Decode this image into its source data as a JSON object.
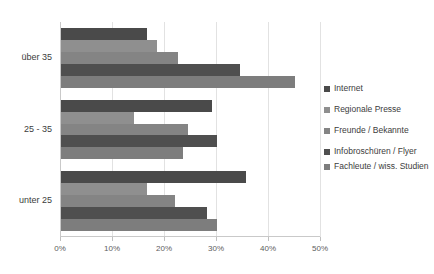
{
  "chart_data": {
    "type": "bar",
    "orientation": "horizontal",
    "title": "",
    "xlabel": "",
    "ylabel": "",
    "xlim": [
      0,
      50
    ],
    "xtick_labels": [
      "0%",
      "10%",
      "20%",
      "30%",
      "40%",
      "50%"
    ],
    "xticks": [
      0,
      10,
      20,
      30,
      40,
      50
    ],
    "grid": true,
    "legend_position": "right",
    "categories": [
      "über 35",
      "25 - 35",
      "unter 25"
    ],
    "series": [
      {
        "name": "Internet",
        "color": "#4a4a4a",
        "values": [
          16.5,
          29.0,
          35.5
        ]
      },
      {
        "name": "Regionale Presse",
        "color": "#8f8f8f",
        "values": [
          18.5,
          14.0,
          16.5
        ]
      },
      {
        "name": "Freunde / Bekannte",
        "color": "#848484",
        "values": [
          22.5,
          24.5,
          22.0
        ]
      },
      {
        "name": "Infobroschüren / Flyer",
        "color": "#4f4f4f",
        "values": [
          34.5,
          30.0,
          28.0
        ]
      },
      {
        "name": "Fachleute / wiss. Studien",
        "color": "#7d7d7d",
        "values": [
          45.0,
          23.5,
          30.0
        ]
      }
    ]
  },
  "legend": {
    "items": [
      {
        "label": "Internet"
      },
      {
        "label": "Regionale Presse"
      },
      {
        "label": "Freunde / Bekannte"
      },
      {
        "label": "Infobroschüren / Flyer"
      },
      {
        "label": "Fachleute / wiss. Studien"
      }
    ]
  }
}
